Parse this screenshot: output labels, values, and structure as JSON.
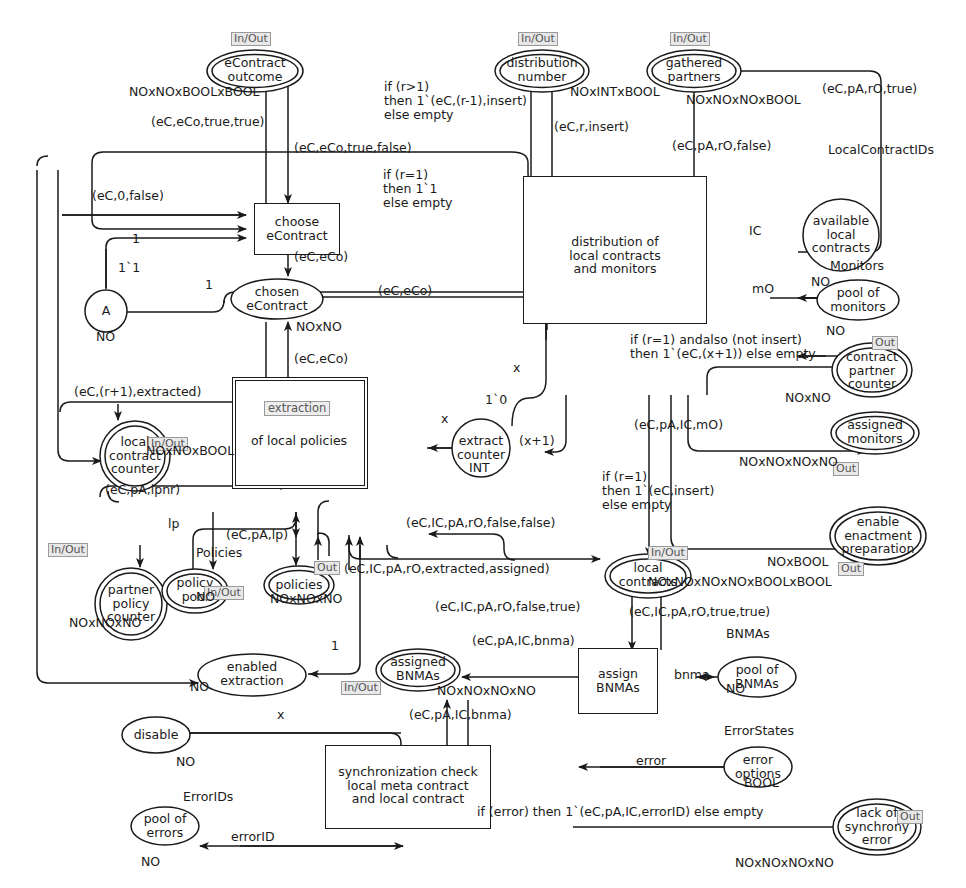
{
  "diagram": {
    "kind": "colored-petri-net"
  },
  "places": [
    {
      "id": "eContractOutcome",
      "label": "eContract\noutcome",
      "shape": "ellipse",
      "double": true,
      "port": "In/Out",
      "type": "NOxNOxBOOLxBOOL",
      "x": 255,
      "y": 48,
      "w": 100,
      "h": 46
    },
    {
      "id": "distributionNumber",
      "label": "distribution\nnumber",
      "shape": "ellipse",
      "double": true,
      "port": "In/Out",
      "type": "NOxINTxBOOL",
      "x": 491,
      "y": 48,
      "w": 96,
      "h": 46
    },
    {
      "id": "gatheredPartners",
      "label": "gathered\npartners",
      "shape": "ellipse",
      "double": true,
      "port": "In/Out",
      "type": "NOxNOxNOxBOOL",
      "x": 644,
      "y": 48,
      "w": 96,
      "h": 46
    },
    {
      "id": "availableLocalContracts",
      "label": "available\nlocal\ncontracts",
      "shape": "circle",
      "double": false,
      "port": "",
      "type": "NO",
      "typeTop": "LocalContractIDs",
      "x": 841,
      "y": 197,
      "w": 80,
      "h": 76
    },
    {
      "id": "poolOfMonitors",
      "label": "pool of\nmonitors",
      "shape": "ellipse",
      "double": false,
      "port": "",
      "type": "NO",
      "typeTop": "Monitors",
      "x": 856,
      "y": 277,
      "w": 86,
      "h": 44
    },
    {
      "id": "chosenEContract",
      "label": "chosen\neContract",
      "shape": "ellipse",
      "double": false,
      "port": "",
      "type": "NOxNO",
      "x": 257,
      "y": 277,
      "w": 96,
      "h": 44
    },
    {
      "id": "placeA",
      "label": "A",
      "shape": "circle",
      "double": false,
      "port": "",
      "type": "NO",
      "x": 83,
      "y": 291,
      "w": 46,
      "h": 46
    },
    {
      "id": "localContractCounter",
      "label": "local\ncontract\ncounter",
      "shape": "circle",
      "double": true,
      "port": "In/Out",
      "type": "NOxNOxBOOL",
      "x": 108,
      "y": 424,
      "w": 72,
      "h": 72
    },
    {
      "id": "extractCounter",
      "label": "extract\ncounter",
      "shape": "circle",
      "double": false,
      "port": "",
      "type": "INT",
      "x": 481,
      "y": 428,
      "w": 62,
      "h": 62
    },
    {
      "id": "contractPartnerCounter",
      "label": "contract\npartner\ncounter",
      "shape": "ellipse",
      "double": true,
      "port": "Out",
      "type": "NOxNO",
      "x": 872,
      "y": 369,
      "w": 84,
      "h": 56
    },
    {
      "id": "assignedMonitors",
      "label": "assigned\nmonitors",
      "shape": "ellipse",
      "double": true,
      "port": "Out",
      "type": "NOxNOxNOxNO",
      "x": 875,
      "y": 432,
      "w": 92,
      "h": 46
    },
    {
      "id": "enableEnactmentPreparation",
      "label": "enable\nenactment\npreparation",
      "shape": "ellipse",
      "double": true,
      "port": "Out",
      "type": "NOxBOOL",
      "x": 875,
      "y": 518,
      "w": 96,
      "h": 56
    },
    {
      "id": "partnerPolicyCounter",
      "label": "partner\npolicy\ncounter",
      "shape": "circle",
      "double": true,
      "port": "In/Out",
      "type": "NOxNOxNO",
      "x": 103,
      "y": 571,
      "w": 74,
      "h": 74
    },
    {
      "id": "policyPool",
      "label": "policy\npool",
      "shape": "ellipse",
      "double": true,
      "port": "In/Out",
      "type": "NO",
      "typeTop": "Policies",
      "x": 191,
      "y": 575,
      "w": 68,
      "h": 42
    },
    {
      "id": "policies",
      "label": "policies",
      "shape": "ellipse",
      "double": true,
      "port": "Out",
      "type": "NOxNOxNO",
      "x": 294,
      "y": 578,
      "w": 72,
      "h": 38
    },
    {
      "id": "localContracts",
      "label": "local\ncontracts",
      "shape": "ellipse",
      "double": true,
      "port": "In/Out",
      "type": "NOxNOxNOxNOxBOOLxBOOL",
      "x": 608,
      "y": 563,
      "w": 86,
      "h": 44
    },
    {
      "id": "enabledExtraction",
      "label": "enabled\nextraction",
      "shape": "ellipse",
      "double": false,
      "port": "",
      "type": "NO",
      "x": 208,
      "y": 661,
      "w": 96,
      "h": 44
    },
    {
      "id": "assignedBNMAs",
      "label": "assigned\nBNMAs",
      "shape": "ellipse",
      "double": true,
      "port": "In/Out",
      "type": "NOxNOxNOxNO",
      "x": 410,
      "y": 655,
      "w": 86,
      "h": 42
    },
    {
      "id": "poolOfBNMAs",
      "label": "pool of\nBNMAs",
      "shape": "ellipse",
      "double": false,
      "port": "",
      "type": "NO",
      "typeTop": "BNMAs",
      "x": 718,
      "y": 655,
      "w": 80,
      "h": 42
    },
    {
      "id": "disable",
      "label": "disable",
      "shape": "ellipse",
      "double": false,
      "port": "",
      "type": "NO",
      "x": 153,
      "y": 737,
      "w": 70,
      "h": 38
    },
    {
      "id": "errorOptions",
      "label": "error\noptions",
      "shape": "ellipse",
      "double": false,
      "port": "",
      "type": "BOOL",
      "typeTop": "ErrorStates",
      "x": 755,
      "y": 753,
      "w": 70,
      "h": 42
    },
    {
      "id": "lackOfSynchronyError",
      "label": "lack of\nsynchrony\nerror",
      "shape": "ellipse",
      "double": true,
      "port": "Out",
      "type": "NOxNOxNOxNO",
      "x": 874,
      "y": 818,
      "w": 90,
      "h": 52
    },
    {
      "id": "poolOfErrors",
      "label": "pool of\nerrors",
      "shape": "ellipse",
      "double": false,
      "port": "",
      "type": "NO",
      "typeTop": "ErrorIDs",
      "x": 164,
      "y": 820,
      "w": 70,
      "h": 40
    }
  ],
  "transitions": [
    {
      "id": "chooseEContract",
      "label": "choose\neContract",
      "sub": "",
      "x": 254,
      "y": 206,
      "w": 84,
      "h": 46
    },
    {
      "id": "distributionOfLocalContracts",
      "label": "distribution of\nlocal contracts\nand monitors",
      "sub": "",
      "x": 614,
      "y": 247,
      "w": 182,
      "h": 146
    },
    {
      "id": "extractionOfLocalPolicies",
      "label": "of local policies",
      "sub": "extraction",
      "x": 297,
      "y": 429,
      "w": 128,
      "h": 104,
      "substitution": true
    },
    {
      "id": "assignBNMAs",
      "label": "assign\nBNMAs",
      "x": 616,
      "y": 654,
      "w": 76,
      "h": 62
    },
    {
      "id": "syncCheck",
      "label": "synchronization check\nlocal meta contract\nand local contract",
      "x": 407,
      "y": 787,
      "w": 164,
      "h": 78
    }
  ],
  "arc_labels": [
    {
      "id": "a1",
      "text": "NOxNOxBOOLxBOOL",
      "x": 135,
      "y": 85
    },
    {
      "id": "a2",
      "text": "(eC,eCo,true,true)",
      "x": 150,
      "y": 122
    },
    {
      "id": "a3",
      "text": "(eC,eCo,true,false)",
      "x": 295,
      "y": 141
    },
    {
      "id": "a4",
      "text": "if (r>1)\nthen 1`(eC,(r-1),insert)\nelse empty",
      "x": 384,
      "y": 84
    },
    {
      "id": "a5",
      "text": "if (r=1)\nthen 1`1\nelse empty",
      "x": 382,
      "y": 172
    },
    {
      "id": "a6",
      "text": "NOxINTxBOOL",
      "x": 571,
      "y": 90
    },
    {
      "id": "a7",
      "text": "(eC,r,insert)",
      "x": 552,
      "y": 126
    },
    {
      "id": "a8",
      "text": "NOxNOxNOxBOOL",
      "x": 692,
      "y": 98
    },
    {
      "id": "a9",
      "text": "(eC,pA,rO,false)",
      "x": 680,
      "y": 143
    },
    {
      "id": "a10",
      "text": "(eC,pA,rO,true)",
      "x": 823,
      "y": 88
    },
    {
      "id": "a11",
      "text": "LocalContractIDs",
      "x": 828,
      "y": 150
    },
    {
      "id": "a12",
      "text": "IC",
      "x": 752,
      "y": 231
    },
    {
      "id": "a13",
      "text": "NO",
      "x": 822,
      "y": 247
    },
    {
      "id": "a14",
      "text": "Monitors",
      "x": 845,
      "y": 257
    },
    {
      "id": "a15",
      "text": "mO",
      "x": 756,
      "y": 289
    },
    {
      "id": "a16",
      "text": "NO",
      "x": 836,
      "y": 313
    },
    {
      "id": "a17",
      "text": "(eC,0,false)",
      "x": 96,
      "y": 194
    },
    {
      "id": "a18",
      "text": "1",
      "x": 132,
      "y": 239
    },
    {
      "id": "a19",
      "text": "1`1",
      "x": 122,
      "y": 268
    },
    {
      "id": "a20",
      "text": "1",
      "x": 210,
      "y": 286
    },
    {
      "id": "a21",
      "text": "NO",
      "x": 101,
      "y": 330
    },
    {
      "id": "a22",
      "text": "(eC,eCo)",
      "x": 295,
      "y": 256
    },
    {
      "id": "a23",
      "text": "(eC,eCo)",
      "x": 381,
      "y": 290
    },
    {
      "id": "a24",
      "text": "NOxNO",
      "x": 295,
      "y": 326
    },
    {
      "id": "a25",
      "text": "(eC,eCo)",
      "x": 295,
      "y": 358
    },
    {
      "id": "a26",
      "text": "(eC,(r+1),extracted)",
      "x": 80,
      "y": 391
    },
    {
      "id": "a27",
      "text": "NOxNOxBOOL",
      "x": 138,
      "y": 449
    },
    {
      "id": "a28",
      "text": "x",
      "x": 443,
      "y": 418
    },
    {
      "id": "a29",
      "text": "x",
      "x": 516,
      "y": 367
    },
    {
      "id": "a30",
      "text": "1`0",
      "x": 489,
      "y": 399
    },
    {
      "id": "a31",
      "text": "(x+1)",
      "x": 521,
      "y": 440
    },
    {
      "id": "a32",
      "text": "INT",
      "x": 500,
      "y": 464
    },
    {
      "id": "a33",
      "text": "if (r=1) andalso (not insert)\nthen 1`(eC,(x+1)) else empty",
      "x": 634,
      "y": 339
    },
    {
      "id": "a34",
      "text": "NOxNO",
      "x": 789,
      "y": 397
    },
    {
      "id": "a35",
      "text": "(eC,pA,IC,mO)",
      "x": 637,
      "y": 424
    },
    {
      "id": "a36",
      "text": "NOxNOxNOxNO",
      "x": 743,
      "y": 462
    },
    {
      "id": "a37",
      "text": "if (r=1)\nthen 1`(eC,insert)\nelse empty",
      "x": 605,
      "y": 477
    },
    {
      "id": "a38",
      "text": "NOxBOOL",
      "x": 771,
      "y": 562
    },
    {
      "id": "a39",
      "text": "(eC,pA,lpnr)",
      "x": 108,
      "y": 489
    },
    {
      "id": "a40",
      "text": "lp",
      "x": 172,
      "y": 523
    },
    {
      "id": "a41",
      "text": "Policies",
      "x": 200,
      "y": 552
    },
    {
      "id": "a42",
      "text": "(eC,pA,lp)",
      "x": 228,
      "y": 534
    },
    {
      "id": "a43",
      "text": "NO",
      "x": 205,
      "y": 597
    },
    {
      "id": "a44",
      "text": "NOxNOxNO",
      "x": 281,
      "y": 597
    },
    {
      "id": "a45",
      "text": "NOxNOxNO",
      "x": 73,
      "y": 621
    },
    {
      "id": "a46",
      "text": "(eC,IC,pA,rO,false,false)",
      "x": 410,
      "y": 522
    },
    {
      "id": "a47",
      "text": "(eC,IC,pA,rO,extracted,assigned)",
      "x": 348,
      "y": 568
    },
    {
      "id": "a48",
      "text": "NOxNOxNOxNOxBOOLxBOOL",
      "x": 653,
      "y": 581
    },
    {
      "id": "a49",
      "text": "(eC,IC,pA,rO,false,true)",
      "x": 440,
      "y": 606
    },
    {
      "id": "a50",
      "text": "(eC,IC,pA,rO,true,true)",
      "x": 634,
      "y": 611
    },
    {
      "id": "a51",
      "text": "1",
      "x": 334,
      "y": 645
    },
    {
      "id": "a52",
      "text": "(eC,pA,IC,bnma)",
      "x": 478,
      "y": 640
    },
    {
      "id": "a53",
      "text": "BNMAs",
      "x": 729,
      "y": 633
    },
    {
      "id": "a54",
      "text": "bnma",
      "x": 680,
      "y": 674
    },
    {
      "id": "a55",
      "text": "NO",
      "x": 730,
      "y": 688
    },
    {
      "id": "a56",
      "text": "NO",
      "x": 195,
      "y": 686
    },
    {
      "id": "a57",
      "text": "NOxNOxNOxNO",
      "x": 441,
      "y": 689
    },
    {
      "id": "a58",
      "text": "x",
      "x": 280,
      "y": 714
    },
    {
      "id": "a59",
      "text": "(eC,pA,IC,bnma)",
      "x": 414,
      "y": 714
    },
    {
      "id": "a60",
      "text": "NO",
      "x": 179,
      "y": 761
    },
    {
      "id": "a61",
      "text": "ErrorStates",
      "x": 730,
      "y": 730
    },
    {
      "id": "a62",
      "text": "error",
      "x": 640,
      "y": 760
    },
    {
      "id": "a63",
      "text": "BOOL",
      "x": 748,
      "y": 782
    },
    {
      "id": "a64",
      "text": "ErrorIDs",
      "x": 188,
      "y": 796
    },
    {
      "id": "a65",
      "text": "if (error) then 1`(eC,pA,IC,errorID) else empty",
      "x": 480,
      "y": 811
    },
    {
      "id": "a66",
      "text": "errorID",
      "x": 237,
      "y": 836
    },
    {
      "id": "a67",
      "text": "NO",
      "x": 145,
      "y": 861
    },
    {
      "id": "a68",
      "text": "NOxNOxNOxNO",
      "x": 740,
      "y": 862
    }
  ],
  "colors": {
    "stroke": "#1a1a1a",
    "background": "#ffffff",
    "tag_bg": "#e8e8e8",
    "tag_border": "#9a9a9a",
    "tag_text": "#555555"
  }
}
